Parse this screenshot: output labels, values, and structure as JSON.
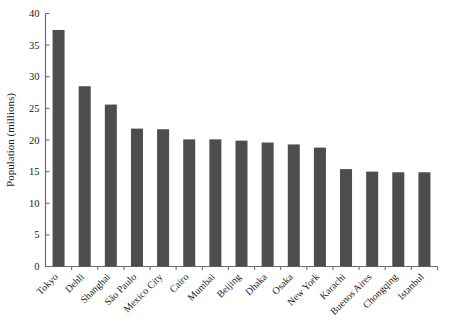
{
  "chart_data": {
    "type": "bar",
    "title": "",
    "xlabel": "",
    "ylabel": "Population (millions)",
    "ylim": [
      0,
      40
    ],
    "yticks": [
      0,
      5,
      10,
      15,
      20,
      25,
      30,
      35,
      40
    ],
    "grid": false,
    "legend": null,
    "bar_color": "#4d4d4d",
    "axis_color": "#6f6f6f",
    "categories": [
      "Tokyo",
      "Dehli",
      "Shanghai",
      "São Paulo",
      "Mexico City",
      "Cairo",
      "Mumbai",
      "Beijing",
      "Dhaka",
      "Osaka",
      "New York",
      "Karachi",
      "Buenos Aires",
      "Chongqing",
      "Istanbul"
    ],
    "values": [
      37.4,
      28.5,
      25.6,
      21.8,
      21.7,
      20.1,
      20.1,
      19.9,
      19.6,
      19.3,
      18.8,
      15.4,
      15.0,
      14.9,
      14.9
    ]
  }
}
